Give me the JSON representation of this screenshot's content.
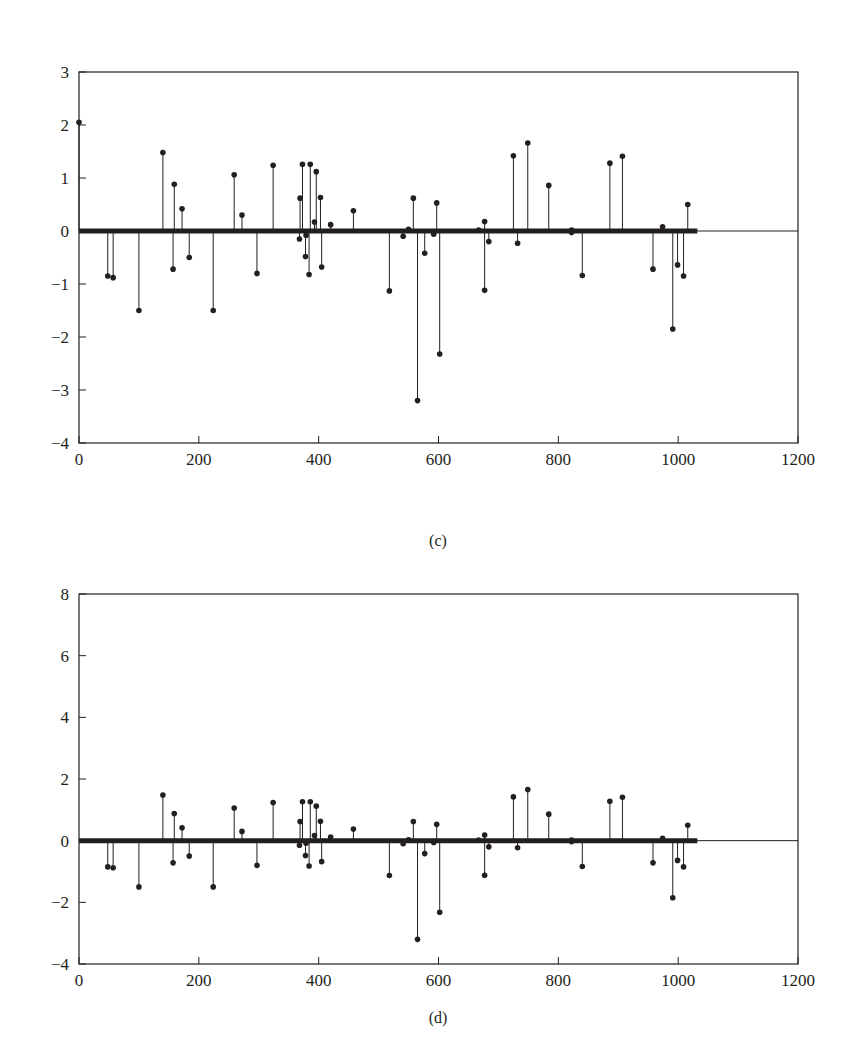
{
  "chart_data": [
    {
      "id": "c",
      "type": "stem",
      "caption": "(c)",
      "title": "",
      "xlabel": "",
      "ylabel": "",
      "xlim": [
        0,
        1200
      ],
      "ylim": [
        -4,
        3
      ],
      "xticks": [
        0,
        200,
        400,
        600,
        800,
        1000,
        1200
      ],
      "yticks": [
        -4,
        -3,
        -2,
        -1,
        0,
        1,
        2,
        3
      ],
      "grid": false,
      "legend": null,
      "baseline": {
        "y": 0,
        "thick_until_x": 1032
      },
      "x": [
        0,
        48,
        57,
        100,
        140,
        157,
        159,
        172,
        184,
        224,
        259,
        272,
        297,
        324,
        368,
        369,
        373,
        378,
        379,
        384,
        386,
        393,
        396,
        403,
        405,
        420,
        458,
        518,
        541,
        550,
        558,
        565,
        577,
        592,
        597,
        602,
        667,
        677,
        677,
        684,
        725,
        732,
        749,
        784,
        822,
        822,
        840,
        886,
        907,
        958,
        974,
        991,
        999,
        1009,
        1016
      ],
      "values": [
        2.05,
        -0.85,
        -0.88,
        -1.5,
        1.48,
        -0.72,
        0.88,
        0.42,
        -0.5,
        -1.5,
        1.06,
        0.3,
        -0.8,
        1.24,
        -0.15,
        0.62,
        1.26,
        -0.48,
        -0.08,
        -0.82,
        1.26,
        0.17,
        1.12,
        0.63,
        -0.68,
        0.12,
        0.38,
        -1.13,
        -0.1,
        0.03,
        0.62,
        -3.2,
        -0.42,
        -0.06,
        0.53,
        -2.32,
        0.02,
        0.18,
        -1.12,
        -0.2,
        1.42,
        -0.23,
        1.66,
        0.86,
        0.02,
        -0.03,
        -0.84,
        1.28,
        1.41,
        -0.72,
        0.08,
        -1.85,
        -0.64,
        -0.85,
        0.5
      ]
    },
    {
      "id": "d",
      "type": "stem",
      "caption": "(d)",
      "title": "",
      "xlabel": "",
      "ylabel": "",
      "xlim": [
        0,
        1200
      ],
      "ylim": [
        -4,
        8
      ],
      "xticks": [
        0,
        200,
        400,
        600,
        800,
        1000,
        1200
      ],
      "yticks": [
        -4,
        -2,
        0,
        2,
        4,
        6,
        8
      ],
      "grid": false,
      "legend": null,
      "baseline": {
        "y": 0,
        "thick_until_x": 1032
      },
      "x": [
        48,
        57,
        100,
        140,
        157,
        159,
        172,
        184,
        224,
        259,
        272,
        297,
        324,
        368,
        369,
        373,
        378,
        379,
        384,
        386,
        393,
        396,
        403,
        405,
        420,
        458,
        518,
        541,
        550,
        558,
        565,
        577,
        592,
        597,
        602,
        667,
        677,
        677,
        684,
        725,
        732,
        749,
        784,
        822,
        822,
        840,
        886,
        907,
        958,
        974,
        991,
        999,
        1009,
        1016
      ],
      "values": [
        -0.85,
        -0.88,
        -1.5,
        1.48,
        -0.72,
        0.88,
        0.42,
        -0.5,
        -1.5,
        1.06,
        0.3,
        -0.8,
        1.24,
        -0.15,
        0.62,
        1.26,
        -0.48,
        -0.08,
        -0.82,
        1.26,
        0.17,
        1.12,
        0.63,
        -0.68,
        0.12,
        0.38,
        -1.13,
        -0.1,
        0.03,
        0.62,
        -3.2,
        -0.42,
        -0.06,
        0.53,
        -2.32,
        0.02,
        0.18,
        -1.12,
        -0.2,
        1.42,
        -0.23,
        1.66,
        0.86,
        0.02,
        -0.03,
        -0.84,
        1.28,
        1.41,
        -0.72,
        0.08,
        -1.85,
        -0.64,
        -0.85,
        0.5
      ]
    }
  ],
  "style": {
    "ink_color": "#231f20",
    "background": "#ffffff"
  }
}
